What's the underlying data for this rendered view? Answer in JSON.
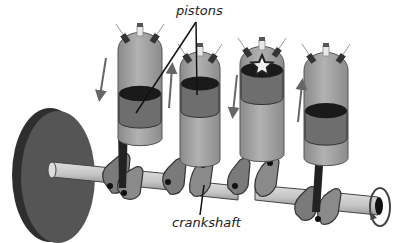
{
  "diagram": {
    "title": "",
    "labels": {
      "pistons": "pistons",
      "crankshaft": "crankshaft"
    },
    "pistons": [
      {
        "id": 1,
        "direction": "down",
        "firing": false,
        "stroke_position": 0.75
      },
      {
        "id": 2,
        "direction": "up",
        "firing": false,
        "stroke_position": 0.25
      },
      {
        "id": 3,
        "direction": "down",
        "firing": true,
        "stroke_position": 0.1
      },
      {
        "id": 4,
        "direction": "up",
        "firing": false,
        "stroke_position": 0.7
      }
    ],
    "components": [
      "flywheel",
      "crankshaft",
      "connecting-rods",
      "cylinders",
      "spark-plugs",
      "rotation-arrow"
    ],
    "colors": {
      "cylinder": "#9a9a9a",
      "cylinder_light": "#b8b8b8",
      "piston_top": "#1a1a1a",
      "piston_body": "#6e6e6e",
      "flywheel": "#4a4a4a",
      "flywheel_edge": "#2e2e2e",
      "shaft": "#c8c8c8",
      "rod": "#222222",
      "crank_arm": "#7a7a7a",
      "arrow": "#666666",
      "text": "#222222"
    }
  }
}
